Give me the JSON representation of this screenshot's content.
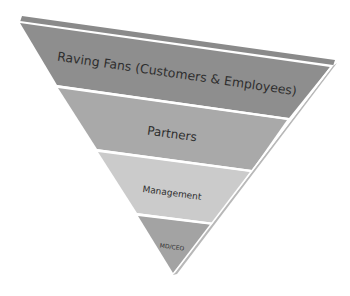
{
  "diagram": {
    "type": "inverted-pyramid",
    "levels": [
      {
        "label": "Raving Fans (Customers & Employees)",
        "color": "#8e8e8e"
      },
      {
        "label": "Partners",
        "color": "#a9a9a9"
      },
      {
        "label": "Management",
        "color": "#cbcbcb"
      },
      {
        "label": "MD/CEO",
        "color": "#a3a3a3"
      }
    ],
    "top_strip_color": "#8a8a8a",
    "separator_color": "#ffffff"
  }
}
